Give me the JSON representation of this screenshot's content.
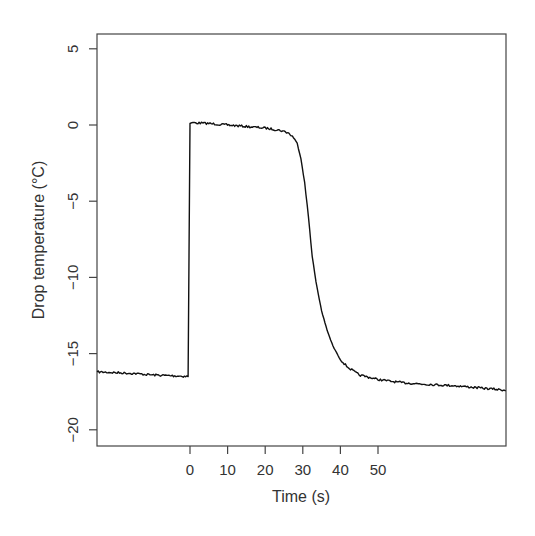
{
  "chart_data": {
    "type": "line",
    "title": "",
    "xlabel": "Time (s)",
    "ylabel": "Drop temperature (°C)",
    "xlim": [
      -24.7,
      84
    ],
    "ylim": [
      -21,
      6
    ],
    "grid": false,
    "legend": null,
    "x_ticks": [
      0,
      10,
      20,
      30,
      40,
      50
    ],
    "x_tick_labels": [
      "0",
      "10",
      "20",
      "30",
      "40",
      "50"
    ],
    "y_ticks": [
      5,
      0,
      -5,
      -10,
      -15,
      -20
    ],
    "y_tick_labels": [
      "5",
      "0",
      "−5",
      "−10",
      "−15",
      "−20"
    ],
    "series": [
      {
        "name": "Drop temperature",
        "color": "#111111",
        "x": [
          -24.7,
          -20,
          -15,
          -10,
          -5,
          -0.5,
          0,
          0.5,
          5,
          10,
          15,
          20,
          24,
          26,
          27.5,
          28.5,
          29.5,
          30.5,
          31.5,
          32.5,
          33.5,
          35,
          36.5,
          38,
          40,
          42,
          45,
          50,
          56,
          62,
          70,
          77,
          84
        ],
        "y": [
          -16.2,
          -16.25,
          -16.3,
          -16.4,
          -16.45,
          -16.5,
          0.1,
          0.15,
          0.1,
          0.0,
          -0.1,
          -0.2,
          -0.35,
          -0.5,
          -0.8,
          -1.2,
          -2.2,
          -3.8,
          -6.0,
          -8.6,
          -10.3,
          -12.2,
          -13.5,
          -14.5,
          -15.4,
          -15.9,
          -16.4,
          -16.7,
          -16.9,
          -17.0,
          -17.1,
          -17.25,
          -17.4
        ]
      }
    ]
  },
  "plot": {
    "xlabel": "Time (s)",
    "ylabel": "Drop temperature (°C)"
  }
}
